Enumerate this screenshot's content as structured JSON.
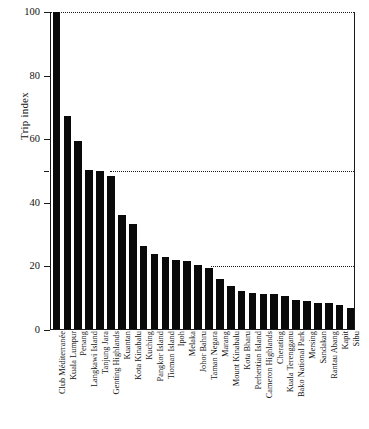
{
  "chart_data": {
    "type": "bar",
    "title": "",
    "subtitle": "",
    "xlabel": "",
    "ylabel": "Trip index",
    "ylim": [
      0,
      100
    ],
    "xlim_note": "categorical",
    "grid": false,
    "legend": null,
    "legend_position": "none",
    "orientation": "vertical",
    "bar_color": "#0a0a0a",
    "axis_color": "#1a1a1a",
    "y_ticks": [
      0,
      20,
      40,
      60,
      80,
      100
    ],
    "y_tick_labels": [
      "0",
      "20",
      "40",
      "60",
      "80",
      "100"
    ],
    "y_minor_ticks": [
      50
    ],
    "reference_lines": [
      {
        "value": 100,
        "style": "dotted",
        "start_fraction": 0.0,
        "end_fraction": 1.0
      },
      {
        "value": 50,
        "style": "dotted",
        "start_fraction": 0.195,
        "end_fraction": 1.0
      },
      {
        "value": 20,
        "style": "dotted",
        "start_fraction": 0.525,
        "end_fraction": 1.0
      }
    ],
    "categories": [
      "Club Méditerranée",
      "Kuala Lumpur",
      "Penang",
      "Langkawi Island",
      "Tanjung Jara",
      "Genting Highlands",
      "Kuantan",
      "Kota Kinabalu",
      "Kuching",
      "Pangkor Island",
      "Tioman Island",
      "Ipoh",
      "Melaka",
      "Johor Bahru",
      "Taman Negara",
      "Marang",
      "Mount Kinabalu",
      "Kota Bharu",
      "Perhentian Island",
      "Cameron Highlands",
      "Cherating",
      "Kuala Terengganu",
      "Bako National Park",
      "Mersing",
      "Sandakan",
      "Rantau Abang",
      "Kapit",
      "Sibu"
    ],
    "values": [
      100,
      67,
      59,
      50,
      49.6,
      48,
      36,
      33,
      26,
      23.5,
      22.7,
      21.8,
      21.4,
      20,
      19.2,
      15.8,
      13.6,
      12.1,
      11.4,
      11,
      11,
      10.5,
      9.2,
      8.8,
      8.1,
      8.1,
      7.6,
      6.7
    ]
  }
}
